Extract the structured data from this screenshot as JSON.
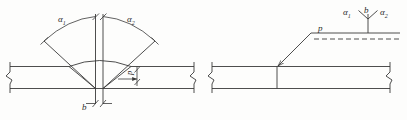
{
  "figure": {
    "title": "",
    "type": "engineering-weld-detail",
    "stroke_color": "#3a3a3a",
    "background": "#fdfdfc"
  },
  "left_diagram": {
    "name": "weld-joint-cross-section",
    "labels": {
      "angle_left": "α",
      "angle_left_sub": "1",
      "angle_right": "α",
      "angle_right_sub": "2",
      "root_gap": "b",
      "root_face": "p"
    }
  },
  "right_diagram": {
    "name": "welding-symbol-notation",
    "labels": {
      "angle_left": "α",
      "angle_left_sub": "1",
      "root_gap": "b",
      "angle_right": "α",
      "angle_right_sub": "2",
      "root_face": "p"
    }
  }
}
